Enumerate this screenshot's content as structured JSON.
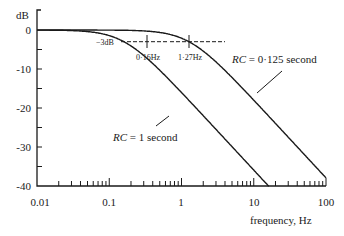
{
  "chart_data": {
    "type": "line",
    "title": "",
    "xlabel": "frequency, Hz",
    "ylabel": "dB",
    "xscale": "log",
    "xlim": [
      0.01,
      100
    ],
    "ylim": [
      -40,
      0
    ],
    "x_ticks": [
      "0.01",
      "0.1",
      "1",
      "10",
      "100"
    ],
    "y_ticks": [
      "0",
      "-10",
      "-20",
      "-30",
      "-40"
    ],
    "grid": false,
    "series": [
      {
        "name": "RC = 1 second",
        "cutoff_hz": 0.16,
        "rolloff_db_per_decade": -20
      },
      {
        "name": "RC = 0·125 second",
        "cutoff_hz": 1.27,
        "rolloff_db_per_decade": -20
      }
    ],
    "annotations": [
      {
        "text": "−3dB",
        "type": "reference-level"
      },
      {
        "text": "0·16Hz",
        "x": 0.16,
        "y": -3
      },
      {
        "text": "1·27Hz",
        "x": 1.27,
        "y": -3
      },
      {
        "text": "RC = 1 second",
        "label_for": "series-0"
      },
      {
        "text": "RC = 0·125 second",
        "label_for": "series-1"
      }
    ]
  },
  "labels": {
    "ylabel": "dB",
    "xlabel": "frequency,  Hz",
    "minus3": "−3dB",
    "f1": "0·16Hz",
    "f2": "1·27Hz",
    "rc1_italic": "RC",
    "rc1_rest": " = 1 second",
    "rc2_italic": "RC",
    "rc2_rest": " = 0·125 second",
    "y0": "0",
    "y10": "-10",
    "y20": "-20",
    "y30": "-30",
    "y40": "-40",
    "x0": "0.01",
    "x1": "0.1",
    "x2": "1",
    "x3": "10",
    "x4": "100"
  }
}
